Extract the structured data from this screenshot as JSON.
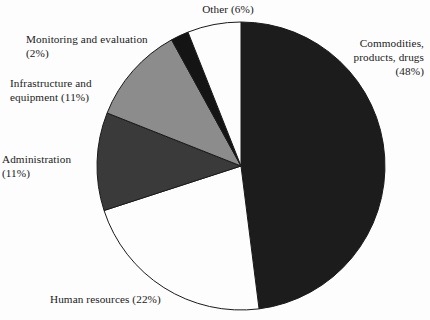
{
  "chart_data": {
    "type": "pie",
    "title": "",
    "subtitle": "",
    "xlabel": "",
    "ylabel": "",
    "legend_position": "none",
    "grid": false,
    "start_angle_deg": 0,
    "direction": "clockwise",
    "units": "percent",
    "categories": [
      "Commodities, products, drugs",
      "Human resources",
      "Administration",
      "Infrastructure and equipment",
      "Monitoring and evaluation",
      "Other"
    ],
    "values": [
      48,
      22,
      11,
      11,
      2,
      6
    ],
    "slices": [
      {
        "name": "Commodities, products, drugs",
        "value": 48,
        "value_text": "(48%)",
        "color": "#1c1c1c",
        "label_lines": "Commodities,\nproducts, drugs\n(48%)"
      },
      {
        "name": "Human resources",
        "value": 22,
        "value_text": "(22%)",
        "color": "#fdfdfd",
        "label_lines": "Human resources (22%)"
      },
      {
        "name": "Administration",
        "value": 11,
        "value_text": "(11%)",
        "color": "#3a3a3a",
        "label_lines": "Administration\n(11%)"
      },
      {
        "name": "Infrastructure and equipment",
        "value": 11,
        "value_text": "(11%)",
        "color": "#8c8c8c",
        "label_lines": "Infrastructure and\nequipment (11%)"
      },
      {
        "name": "Monitoring and evaluation",
        "value": 2,
        "value_text": "(2%)",
        "color": "#141414",
        "label_lines": "Monitoring and evaluation\n(2%)"
      },
      {
        "name": "Other",
        "value": 6,
        "value_text": "(6%)",
        "color": "#fdfdfd",
        "label_lines": "Other (6%)"
      }
    ],
    "geometry": {
      "center_x": 241,
      "center_y": 166,
      "radius": 144
    },
    "styling": {
      "background": "#fdfdfd",
      "outline_color": "#1a1a1a",
      "outline_width": 1,
      "text_color": "#1a1a1a"
    }
  }
}
